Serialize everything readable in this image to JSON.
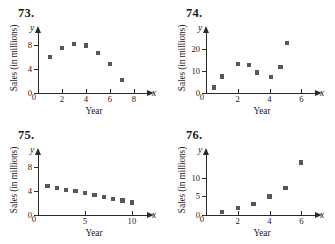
{
  "page": {
    "panels": [
      {
        "number": "73.",
        "chart_data": {
          "type": "scatter",
          "title": "",
          "xlabel": "Year",
          "ylabel": "Sales (in millions)",
          "axis_vars": {
            "x": "x",
            "y": "y"
          },
          "xlim": [
            0,
            9
          ],
          "ylim": [
            0,
            10
          ],
          "xticks": [
            0,
            2,
            4,
            6,
            8
          ],
          "yticks": [
            0,
            4,
            8
          ],
          "grid": false,
          "legend": "none",
          "points": [
            {
              "x": 1,
              "y": 6.0
            },
            {
              "x": 2,
              "y": 7.5
            },
            {
              "x": 3,
              "y": 8.2
            },
            {
              "x": 4,
              "y": 7.9
            },
            {
              "x": 5,
              "y": 6.7
            },
            {
              "x": 6,
              "y": 4.8
            },
            {
              "x": 7,
              "y": 2.2
            }
          ]
        }
      },
      {
        "number": "74.",
        "chart_data": {
          "type": "scatter",
          "title": "",
          "xlabel": "Year",
          "ylabel": "Sales (in millions)",
          "axis_vars": {
            "x": "x",
            "y": "y"
          },
          "xlim": [
            0,
            6.8
          ],
          "ylim": [
            0,
            27
          ],
          "xticks": [
            0,
            2,
            4,
            6
          ],
          "yticks": [
            0,
            10,
            20
          ],
          "grid": false,
          "legend": "none",
          "points": [
            {
              "x": 0.5,
              "y": 2.5
            },
            {
              "x": 1.0,
              "y": 7.5
            },
            {
              "x": 2.0,
              "y": 13.0
            },
            {
              "x": 2.7,
              "y": 12.5
            },
            {
              "x": 3.2,
              "y": 9.3
            },
            {
              "x": 4.1,
              "y": 7.2
            },
            {
              "x": 4.7,
              "y": 11.8
            },
            {
              "x": 5.1,
              "y": 22.5
            }
          ]
        }
      },
      {
        "number": "75.",
        "chart_data": {
          "type": "scatter",
          "title": "",
          "xlabel": "Year",
          "ylabel": "Sales (in millions)",
          "axis_vars": {
            "x": "x",
            "y": "y"
          },
          "xlim": [
            0,
            11.5
          ],
          "ylim": [
            0,
            10
          ],
          "xticks": [
            0,
            5,
            10
          ],
          "yticks": [
            0,
            4,
            8
          ],
          "grid": false,
          "legend": "none",
          "points": [
            {
              "x": 1,
              "y": 4.8
            },
            {
              "x": 2,
              "y": 4.5
            },
            {
              "x": 3,
              "y": 4.2
            },
            {
              "x": 4,
              "y": 4.0
            },
            {
              "x": 5,
              "y": 3.7
            },
            {
              "x": 6,
              "y": 3.3
            },
            {
              "x": 7,
              "y": 3.0
            },
            {
              "x": 8,
              "y": 2.7
            },
            {
              "x": 9,
              "y": 2.4
            },
            {
              "x": 10,
              "y": 2.1
            }
          ]
        }
      },
      {
        "number": "76.",
        "chart_data": {
          "type": "scatter",
          "title": "",
          "xlabel": "Year",
          "ylabel": "Sales (in millions)",
          "axis_vars": {
            "x": "x",
            "y": "y"
          },
          "xlim": [
            0,
            6.8
          ],
          "ylim": [
            0,
            16
          ],
          "xticks": [
            0,
            2,
            4,
            6
          ],
          "yticks": [
            0,
            5,
            10
          ],
          "grid": false,
          "legend": "none",
          "points": [
            {
              "x": 1,
              "y": 0.8
            },
            {
              "x": 2,
              "y": 1.8
            },
            {
              "x": 3,
              "y": 3.0
            },
            {
              "x": 4,
              "y": 4.9
            },
            {
              "x": 5,
              "y": 7.2
            },
            {
              "x": 6,
              "y": 14.0
            }
          ]
        }
      }
    ],
    "colors": {
      "marker": "#575757",
      "axis": "#2b2b2b",
      "text": "#1a1a1a",
      "background": "#ffffff"
    }
  }
}
